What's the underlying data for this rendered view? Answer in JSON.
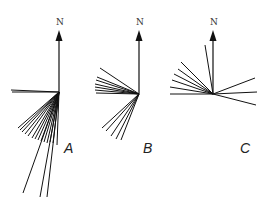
{
  "figure": {
    "stroke_color": "#111111",
    "background": "#ffffff",
    "panels": [
      {
        "id": "A",
        "label": "A",
        "north_label": "N",
        "origin": [
          59,
          92
        ],
        "north_tip": [
          59,
          30
        ],
        "label_pos": [
          64,
          153
        ],
        "north_label_pos": [
          56,
          25
        ],
        "rays": [
          [
            11,
            90
          ],
          [
            12,
            92
          ],
          [
            18,
            128
          ],
          [
            20,
            130
          ],
          [
            22,
            132
          ],
          [
            25,
            134
          ],
          [
            28,
            136
          ],
          [
            32,
            138
          ],
          [
            35,
            139
          ],
          [
            38,
            140
          ],
          [
            41,
            141
          ],
          [
            44,
            142
          ],
          [
            47,
            143
          ],
          [
            50,
            142
          ],
          [
            53,
            143
          ],
          [
            57,
            145
          ],
          [
            23,
            193
          ],
          [
            40,
            197
          ],
          [
            47,
            197
          ]
        ]
      },
      {
        "id": "B",
        "label": "B",
        "north_label": "N",
        "origin": [
          139,
          94
        ],
        "north_tip": [
          139,
          30
        ],
        "label_pos": [
          143,
          153
        ],
        "north_label_pos": [
          136,
          25
        ],
        "rays": [
          [
            100,
            68
          ],
          [
            97,
            77
          ],
          [
            96,
            80
          ],
          [
            95,
            84
          ],
          [
            95,
            87
          ],
          [
            95,
            90
          ],
          [
            96,
            93
          ],
          [
            102,
            128
          ],
          [
            106,
            131
          ],
          [
            111,
            136
          ],
          [
            116,
            139
          ],
          [
            121,
            140
          ]
        ]
      },
      {
        "id": "C",
        "label": "C",
        "north_label": "N",
        "origin": [
          213,
          94
        ],
        "north_tip": [
          213,
          30
        ],
        "label_pos": [
          240,
          153
        ],
        "north_label_pos": [
          210,
          25
        ],
        "rays": [
          [
            205,
            45
          ],
          [
            181,
            62
          ],
          [
            178,
            69
          ],
          [
            174,
            74
          ],
          [
            172,
            80
          ],
          [
            170,
            87
          ],
          [
            170,
            94
          ],
          [
            255,
            78
          ],
          [
            257,
            92
          ],
          [
            256,
            105
          ]
        ]
      }
    ]
  }
}
